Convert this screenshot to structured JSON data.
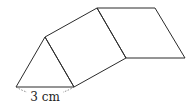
{
  "figure": {
    "dimension_label": "3 cm",
    "stroke_color": "#2b2b2b"
  }
}
